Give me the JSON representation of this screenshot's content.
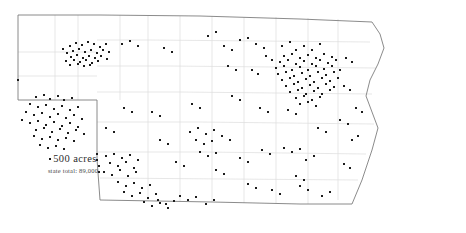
{
  "figure": {
    "map_type": "dot-density",
    "background_color": "#ffffff"
  },
  "legend": {
    "dot_marker": "dot-marker",
    "dot_value_label": "500 acres",
    "state_total_label": "state total: 89,000"
  },
  "style": {
    "state_border_color": "#7e7e7e",
    "county_border_color": "#dcdcdc",
    "dot_color": "#1c1c1c",
    "dot_size_px": 2
  },
  "chart_data": {
    "type": "scatter",
    "title": "",
    "xlabel": "",
    "ylabel": "",
    "dot_unit": "500 acres",
    "state_total": "89,000",
    "xlim": [
      0,
      466
    ],
    "ylim": [
      0,
      233
    ],
    "grid": false,
    "legend_position": "lower-left",
    "state_outline": "M18,15 L18,100 L97,100 L97,159 L100,200 L212,202 L300,204 L352,204 L362,180 L372,150 L378,128 L372,112 L366,96 L370,80 L378,64 L384,48 L380,34 L372,22 L300,19 L200,16 L100,15 Z",
    "county_lines": [
      "M18,52 L97,52",
      "M18,76 L97,76",
      "M55,15 L55,100",
      "M78,15 L78,100",
      "M97,40 L150,40",
      "M97,66 L170,66",
      "M97,92 L180,92",
      "M97,122 L200,122",
      "M97,152 L205,152",
      "M120,15 L120,100",
      "M148,16 L148,200",
      "M180,16 L180,202",
      "M212,16 L212,202",
      "M244,17 L244,203",
      "M276,17 L276,203",
      "M308,18 L308,204",
      "M338,19 L338,200",
      "M150,40 L370,42",
      "M170,66 L376,68",
      "M180,92 L372,94",
      "M200,122 L374,124",
      "M205,152 L366,154",
      "M100,178 L358,180"
    ],
    "dots": [
      [
        63,
        49
      ],
      [
        70,
        46
      ],
      [
        76,
        43
      ],
      [
        82,
        45
      ],
      [
        88,
        42
      ],
      [
        94,
        44
      ],
      [
        100,
        47
      ],
      [
        106,
        44
      ],
      [
        67,
        53
      ],
      [
        73,
        51
      ],
      [
        79,
        49
      ],
      [
        85,
        52
      ],
      [
        91,
        50
      ],
      [
        97,
        53
      ],
      [
        103,
        50
      ],
      [
        109,
        52
      ],
      [
        71,
        57
      ],
      [
        77,
        55
      ],
      [
        83,
        58
      ],
      [
        89,
        56
      ],
      [
        95,
        58
      ],
      [
        101,
        56
      ],
      [
        107,
        59
      ],
      [
        66,
        61
      ],
      [
        74,
        60
      ],
      [
        80,
        62
      ],
      [
        86,
        60
      ],
      [
        92,
        63
      ],
      [
        98,
        61
      ],
      [
        70,
        65
      ],
      [
        78,
        64
      ],
      [
        84,
        66
      ],
      [
        90,
        65
      ],
      [
        122,
        44
      ],
      [
        130,
        41
      ],
      [
        138,
        46
      ],
      [
        18,
        80
      ],
      [
        36,
        97
      ],
      [
        44,
        95
      ],
      [
        50,
        99
      ],
      [
        58,
        96
      ],
      [
        64,
        100
      ],
      [
        72,
        98
      ],
      [
        30,
        104
      ],
      [
        38,
        107
      ],
      [
        46,
        105
      ],
      [
        54,
        109
      ],
      [
        62,
        106
      ],
      [
        70,
        110
      ],
      [
        78,
        107
      ],
      [
        26,
        112
      ],
      [
        34,
        115
      ],
      [
        42,
        113
      ],
      [
        50,
        117
      ],
      [
        58,
        114
      ],
      [
        66,
        118
      ],
      [
        74,
        115
      ],
      [
        82,
        119
      ],
      [
        22,
        120
      ],
      [
        30,
        123
      ],
      [
        38,
        121
      ],
      [
        46,
        125
      ],
      [
        54,
        122
      ],
      [
        62,
        126
      ],
      [
        70,
        123
      ],
      [
        78,
        127
      ],
      [
        36,
        130
      ],
      [
        44,
        128
      ],
      [
        52,
        132
      ],
      [
        60,
        129
      ],
      [
        68,
        133
      ],
      [
        76,
        130
      ],
      [
        84,
        134
      ],
      [
        34,
        136
      ],
      [
        42,
        139
      ],
      [
        50,
        137
      ],
      [
        58,
        140
      ],
      [
        66,
        138
      ],
      [
        74,
        141
      ],
      [
        40,
        145
      ],
      [
        48,
        148
      ],
      [
        56,
        146
      ],
      [
        64,
        149
      ],
      [
        97,
        154
      ],
      [
        97,
        160
      ],
      [
        99,
        166
      ],
      [
        99,
        172
      ],
      [
        106,
        156
      ],
      [
        114,
        154
      ],
      [
        122,
        158
      ],
      [
        130,
        155
      ],
      [
        138,
        160
      ],
      [
        110,
        163
      ],
      [
        118,
        166
      ],
      [
        126,
        162
      ],
      [
        134,
        168
      ],
      [
        104,
        172
      ],
      [
        112,
        175
      ],
      [
        120,
        170
      ],
      [
        128,
        176
      ],
      [
        136,
        172
      ],
      [
        118,
        182
      ],
      [
        126,
        186
      ],
      [
        134,
        183
      ],
      [
        142,
        188
      ],
      [
        150,
        185
      ],
      [
        124,
        192
      ],
      [
        132,
        196
      ],
      [
        140,
        193
      ],
      [
        148,
        198
      ],
      [
        156,
        194
      ],
      [
        144,
        202
      ],
      [
        152,
        206
      ],
      [
        160,
        203
      ],
      [
        168,
        208
      ],
      [
        158,
        200
      ],
      [
        166,
        204
      ],
      [
        174,
        201
      ],
      [
        180,
        196
      ],
      [
        188,
        200
      ],
      [
        196,
        197
      ],
      [
        206,
        204
      ],
      [
        214,
        200
      ],
      [
        190,
        132
      ],
      [
        198,
        128
      ],
      [
        206,
        134
      ],
      [
        214,
        130
      ],
      [
        196,
        140
      ],
      [
        204,
        144
      ],
      [
        212,
        141
      ],
      [
        200,
        152
      ],
      [
        208,
        156
      ],
      [
        216,
        153
      ],
      [
        222,
        136
      ],
      [
        230,
        140
      ],
      [
        240,
        158
      ],
      [
        248,
        162
      ],
      [
        262,
        150
      ],
      [
        270,
        154
      ],
      [
        284,
        148
      ],
      [
        292,
        152
      ],
      [
        300,
        149
      ],
      [
        306,
        160
      ],
      [
        314,
        156
      ],
      [
        296,
        176
      ],
      [
        304,
        180
      ],
      [
        322,
        196
      ],
      [
        330,
        192
      ],
      [
        224,
        46
      ],
      [
        232,
        50
      ],
      [
        256,
        44
      ],
      [
        264,
        48
      ],
      [
        282,
        46
      ],
      [
        290,
        42
      ],
      [
        296,
        50
      ],
      [
        304,
        46
      ],
      [
        312,
        50
      ],
      [
        320,
        44
      ],
      [
        284,
        56
      ],
      [
        292,
        54
      ],
      [
        300,
        58
      ],
      [
        308,
        55
      ],
      [
        316,
        58
      ],
      [
        324,
        54
      ],
      [
        332,
        57
      ],
      [
        280,
        62
      ],
      [
        288,
        60
      ],
      [
        296,
        64
      ],
      [
        304,
        61
      ],
      [
        312,
        64
      ],
      [
        320,
        60
      ],
      [
        328,
        63
      ],
      [
        336,
        60
      ],
      [
        276,
        68
      ],
      [
        284,
        66
      ],
      [
        292,
        70
      ],
      [
        300,
        67
      ],
      [
        308,
        70
      ],
      [
        316,
        66
      ],
      [
        324,
        69
      ],
      [
        332,
        66
      ],
      [
        340,
        70
      ],
      [
        278,
        74
      ],
      [
        286,
        72
      ],
      [
        294,
        76
      ],
      [
        302,
        73
      ],
      [
        310,
        76
      ],
      [
        318,
        72
      ],
      [
        326,
        75
      ],
      [
        334,
        72
      ],
      [
        282,
        80
      ],
      [
        290,
        78
      ],
      [
        298,
        82
      ],
      [
        306,
        79
      ],
      [
        314,
        82
      ],
      [
        322,
        78
      ],
      [
        330,
        81
      ],
      [
        338,
        78
      ],
      [
        286,
        86
      ],
      [
        294,
        84
      ],
      [
        302,
        88
      ],
      [
        310,
        85
      ],
      [
        318,
        88
      ],
      [
        326,
        84
      ],
      [
        334,
        87
      ],
      [
        290,
        92
      ],
      [
        298,
        90
      ],
      [
        306,
        94
      ],
      [
        314,
        91
      ],
      [
        322,
        94
      ],
      [
        330,
        90
      ],
      [
        296,
        98
      ],
      [
        304,
        96
      ],
      [
        312,
        100
      ],
      [
        320,
        97
      ],
      [
        300,
        104
      ],
      [
        308,
        102
      ],
      [
        316,
        106
      ],
      [
        288,
        110
      ],
      [
        296,
        114
      ],
      [
        346,
        58
      ],
      [
        352,
        62
      ],
      [
        344,
        86
      ],
      [
        350,
        90
      ],
      [
        266,
        56
      ],
      [
        272,
        60
      ],
      [
        252,
        70
      ],
      [
        258,
        74
      ],
      [
        240,
        40
      ],
      [
        248,
        38
      ],
      [
        208,
        36
      ],
      [
        216,
        32
      ],
      [
        164,
        48
      ],
      [
        172,
        52
      ],
      [
        228,
        66
      ],
      [
        236,
        70
      ],
      [
        356,
        108
      ],
      [
        362,
        112
      ],
      [
        340,
        120
      ],
      [
        348,
        124
      ],
      [
        352,
        140
      ],
      [
        358,
        136
      ],
      [
        344,
        164
      ],
      [
        350,
        168
      ],
      [
        318,
        128
      ],
      [
        326,
        132
      ],
      [
        260,
        108
      ],
      [
        268,
        112
      ],
      [
        232,
        96
      ],
      [
        240,
        100
      ],
      [
        192,
        104
      ],
      [
        200,
        108
      ],
      [
        152,
        112
      ],
      [
        160,
        116
      ],
      [
        124,
        108
      ],
      [
        132,
        112
      ],
      [
        106,
        128
      ],
      [
        114,
        132
      ],
      [
        160,
        140
      ],
      [
        168,
        144
      ],
      [
        176,
        162
      ],
      [
        184,
        166
      ],
      [
        216,
        170
      ],
      [
        224,
        174
      ],
      [
        248,
        184
      ],
      [
        256,
        188
      ],
      [
        272,
        190
      ],
      [
        280,
        194
      ],
      [
        300,
        186
      ],
      [
        308,
        190
      ]
    ]
  }
}
